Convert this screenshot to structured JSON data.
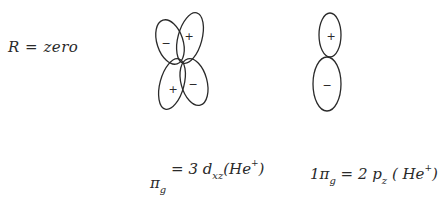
{
  "left_label": {
    "text": "R = zero"
  },
  "d_orbital": {
    "name": "3d_xz",
    "lobes": [
      {
        "position": "top-left",
        "sign": "−"
      },
      {
        "position": "top-right",
        "sign": "+"
      },
      {
        "position": "bottom-left",
        "sign": "+"
      },
      {
        "position": "bottom-right",
        "sign": "−"
      }
    ]
  },
  "p_orbital": {
    "name": "2p_z",
    "lobes": [
      {
        "position": "top",
        "sign": "+"
      },
      {
        "position": "bottom",
        "sign": "−"
      }
    ]
  },
  "labels": {
    "pi_g": {
      "prefix": "π",
      "sub": "g",
      "eq": " = 3 d",
      "orb_sub": "xz",
      "atom": "(He",
      "charge": "+",
      "close": ")"
    },
    "one_pi_g": {
      "prefix": "1π",
      "sub": "g",
      "eq": " = 2 p",
      "orb_sub": "z",
      "atom": " ( He",
      "charge": "+",
      "close": ")"
    }
  },
  "colors": {
    "ink": "#2a2a2a",
    "background": "#ffffff"
  }
}
